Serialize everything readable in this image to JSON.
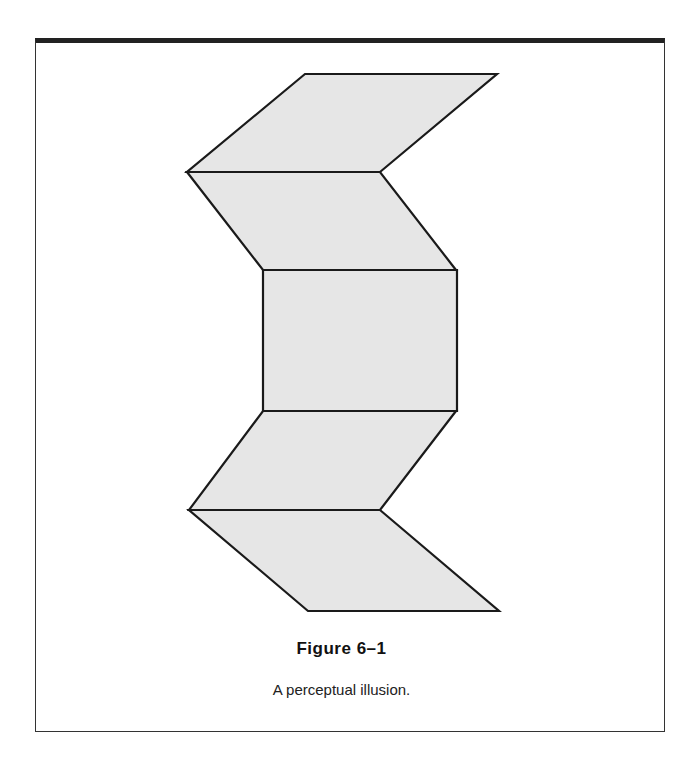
{
  "figure": {
    "title": "Figure 6–1",
    "caption": "A perceptual illusion.",
    "fill_color": "#e6e6e6",
    "stroke_color": "#1a1a1a",
    "shapes": [
      {
        "name": "top-parallelogram",
        "points": "305,74 497,74 380,172 187,172"
      },
      {
        "name": "upper-parallelogram",
        "points": "187,172 380,172 456,270 263,270"
      },
      {
        "name": "center-rectangle",
        "points": "263,270 457,270 457,411 263,411"
      },
      {
        "name": "lower-parallelogram",
        "points": "263,411 456,411 380,510 189,510"
      },
      {
        "name": "bottom-parallelogram",
        "points": "189,510 380,510 499,611 308,611"
      }
    ]
  }
}
